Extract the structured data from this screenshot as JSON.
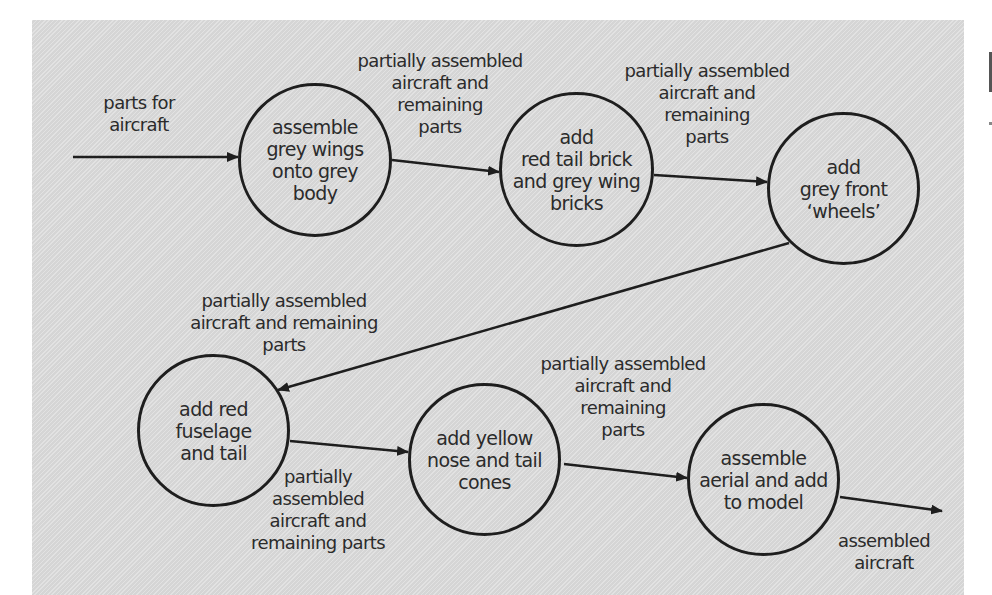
{
  "diagram": {
    "type": "process-flow",
    "colors": {
      "background": "#dcdcdc",
      "stroke": "#1e1e1e",
      "text": "#2b2b2b"
    },
    "nodes": [
      {
        "id": "n1",
        "label": "assemble\ngrey wings\nonto grey\nbody"
      },
      {
        "id": "n2",
        "label": "add\nred tail brick\nand grey wing\nbricks"
      },
      {
        "id": "n3",
        "label": "add\ngrey front\n‘wheels’"
      },
      {
        "id": "n4",
        "label": "add red\nfuselage\nand tail"
      },
      {
        "id": "n5",
        "label": "add yellow\nnose and tail\ncones"
      },
      {
        "id": "n6",
        "label": "assemble\naerial and add\nto model"
      }
    ],
    "flows": [
      {
        "from": "input",
        "to": "n1",
        "label": "parts for\naircraft"
      },
      {
        "from": "n1",
        "to": "n2",
        "label": "partially assembled\naircraft and\nremaining\nparts"
      },
      {
        "from": "n2",
        "to": "n3",
        "label": "partially assembled\naircraft and\nremaining\nparts"
      },
      {
        "from": "n3",
        "to": "n4",
        "label": "partially assembled\naircraft and remaining\nparts"
      },
      {
        "from": "n4",
        "to": "n5",
        "label": "partially\nassembled\naircraft and\nremaining parts"
      },
      {
        "from": "n5",
        "to": "n6",
        "label": "partially assembled\naircraft and\nremaining\nparts"
      },
      {
        "from": "n6",
        "to": "output",
        "label": "assembled\naircraft"
      }
    ]
  }
}
